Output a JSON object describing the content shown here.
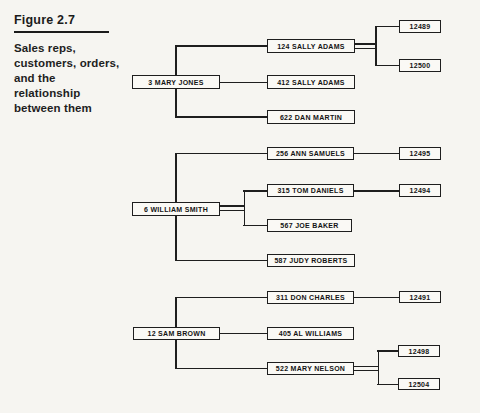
{
  "figure": {
    "label": "Figure 2.7",
    "caption_lines": [
      "Sales reps,",
      "customers, orders,",
      "and the",
      "relationship",
      "between them"
    ]
  },
  "diagram": {
    "reps": [
      {
        "label": "3 MARY JONES",
        "customers": [
          {
            "label": "124 SALLY ADAMS",
            "orders": [
              "12489",
              "12500"
            ]
          },
          {
            "label": "412 SALLY ADAMS",
            "orders": []
          },
          {
            "label": "622 DAN MARTIN",
            "orders": []
          }
        ]
      },
      {
        "label": "6 WILLIAM SMITH",
        "customers": [
          {
            "label": "256 ANN SAMUELS",
            "orders": [
              "12495"
            ]
          },
          {
            "label": "315 TOM DANIELS",
            "orders": [
              "12494"
            ]
          },
          {
            "label": "567 JOE BAKER",
            "orders": []
          },
          {
            "label": "587 JUDY ROBERTS",
            "orders": []
          }
        ]
      },
      {
        "label": "12 SAM BROWN",
        "customers": [
          {
            "label": "311 DON CHARLES",
            "orders": [
              "12491"
            ]
          },
          {
            "label": "405 AL WILLIAMS",
            "orders": []
          },
          {
            "label": "522 MARY NELSON",
            "orders": [
              "12498",
              "12504"
            ]
          }
        ]
      }
    ]
  },
  "colors": {
    "ink": "#1e1e1e",
    "paper": "#f6f5f1"
  }
}
